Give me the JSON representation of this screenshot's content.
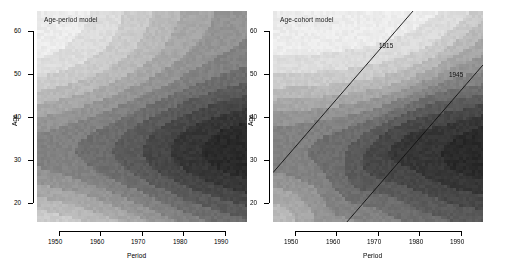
{
  "figure": {
    "background": "#ffffff",
    "panel_count": 2
  },
  "panels": [
    {
      "id": "age-period",
      "title": "Age-period model",
      "xlabel": "Period",
      "ylabel": "Age",
      "xticks": [
        "1950",
        "1960",
        "1970",
        "1980",
        "1990"
      ],
      "yticks": [
        "60",
        "50",
        "40",
        "30",
        "20"
      ],
      "cohort_lines": []
    },
    {
      "id": "age-cohort",
      "title": "Age-cohort model",
      "xlabel": "Period",
      "ylabel": "Age",
      "xticks": [
        "1950",
        "1960",
        "1970",
        "1980",
        "1990"
      ],
      "yticks": [
        "60",
        "50",
        "40",
        "30",
        "20"
      ],
      "cohort_lines": [
        {
          "label": "1915"
        },
        {
          "label": "1945"
        }
      ]
    }
  ],
  "chart_data": {
    "type": "heatmap",
    "title": "",
    "xlabel": "Period",
    "ylabel": "Age",
    "xlim": [
      1943,
      1997
    ],
    "ylim": [
      17,
      64
    ],
    "xticks": [
      1950,
      1960,
      1970,
      1980,
      1990
    ],
    "yticks": [
      20,
      30,
      40,
      50,
      60
    ],
    "grid": false,
    "legend": "none",
    "colormap": "grayscale",
    "colormap_levels": [
      "#ececec",
      "#dcdcdc",
      "#cbcbcb",
      "#b9b9b9",
      "#a7a7a7",
      "#949494",
      "#818181",
      "#6d6d6d",
      "#5a5a5a",
      "#474747",
      "#363636",
      "#292929"
    ],
    "panels": [
      {
        "name": "Age-period model",
        "description": "Smooth grayscale contour surface of fitted rates; bands run diagonally from lower-left to upper-right, darkest (highest) region is a closed lobe centred near period 1990, age 32; lightest (lowest) region occupies the upper-left corner near period 1945, age 62.",
        "peak": {
          "period": 1990,
          "age": 32,
          "level": 11
        },
        "trough": {
          "period": 1945,
          "age": 62,
          "level": 0
        },
        "model": "additive age + period effects"
      },
      {
        "name": "Age-cohort model",
        "description": "Grayscale contour surface with bands aligned along cohort diagonals; a dark lobe near period 1990, age 33 and a secondary dark lobe near period 1973, age 33; lightest region in the upper-left corner.",
        "peak": {
          "period": 1991,
          "age": 33,
          "level": 11
        },
        "secondary_peak": {
          "period": 1973,
          "age": 34,
          "level": 9
        },
        "trough": {
          "period": 1945,
          "age": 62,
          "level": 0
        },
        "model": "additive age + cohort effects",
        "cohort_lines": [
          {
            "label": "1915",
            "birth_year": 1915
          },
          {
            "label": "1945",
            "birth_year": 1945
          }
        ]
      }
    ]
  }
}
